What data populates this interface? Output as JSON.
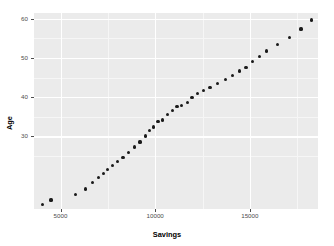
{
  "chart_data": {
    "type": "scatter",
    "title": "",
    "xlabel": "Savings",
    "ylabel": "Age",
    "xlim": [
      3600,
      18600
    ],
    "ylim": [
      11.5,
      61.5
    ],
    "grid": true,
    "legend": "none",
    "point_color": "#1a1a1a",
    "panel_background": "#ebebeb",
    "gridline_color": "#ffffff",
    "x_ticks": [
      5000,
      10000,
      15000
    ],
    "x_tick_labels": [
      "5000",
      "10000",
      "15000"
    ],
    "y_ticks": [
      30,
      40,
      50,
      60
    ],
    "y_tick_labels": [
      "30",
      "40",
      "50",
      "60"
    ],
    "x_minor_ticks": [
      2500,
      7500,
      12500,
      17500
    ],
    "y_minor_ticks": [
      25,
      35,
      45,
      55
    ],
    "n_points": 40,
    "series": [
      {
        "name": "Savings vs Age",
        "x": [
          4050,
          4500,
          5800,
          6300,
          6700,
          7000,
          7250,
          7500,
          7750,
          8000,
          8300,
          8600,
          8900,
          9200,
          9500,
          9700,
          9900,
          10150,
          10400,
          10650,
          10900,
          11150,
          11400,
          11700,
          11950,
          12250,
          12550,
          12900,
          13300,
          13700,
          14100,
          14450,
          14800,
          15150,
          15500,
          15900,
          16450,
          17100,
          17700,
          18250
        ],
        "y": [
          12.6,
          13.8,
          15.3,
          16.6,
          18.3,
          19.6,
          20.6,
          21.6,
          22.5,
          23.6,
          24.7,
          26.0,
          27.3,
          28.6,
          30.1,
          31.5,
          32.4,
          33.9,
          34.2,
          35.6,
          36.6,
          37.6,
          37.8,
          38.7,
          39.9,
          41.0,
          41.8,
          42.4,
          43.6,
          44.6,
          45.6,
          46.7,
          47.7,
          49.1,
          50.4,
          51.8,
          53.4,
          55.3,
          57.4,
          59.7
        ]
      }
    ]
  },
  "axes": {
    "x_title": "Savings",
    "y_title": "Age"
  }
}
